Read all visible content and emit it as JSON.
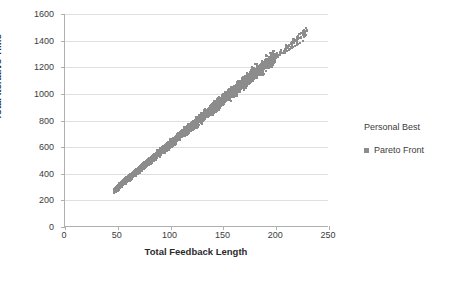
{
  "chart_data": {
    "type": "scatter",
    "title": "",
    "xlabel": "Total Feedback Length",
    "ylabel": "Total Iterative Time",
    "xlim": [
      0,
      250
    ],
    "ylim": [
      0,
      1600
    ],
    "xticks": [
      0,
      50,
      100,
      150,
      200,
      250
    ],
    "yticks": [
      0,
      200,
      400,
      600,
      800,
      1000,
      1200,
      1400,
      1600
    ],
    "grid": "horizontal",
    "legend_position": "right",
    "legend_title": "Personal Best",
    "series": [
      {
        "name": "Pareto Front",
        "color": "#8c8c8c",
        "marker": "square",
        "points": [
          [
            46,
            270
          ],
          [
            47,
            275
          ],
          [
            47,
            285
          ],
          [
            48,
            290
          ],
          [
            48,
            300
          ],
          [
            49,
            295
          ],
          [
            49,
            305
          ],
          [
            50,
            310
          ],
          [
            50,
            318
          ],
          [
            51,
            322
          ],
          [
            52,
            330
          ],
          [
            53,
            338
          ],
          [
            54,
            345
          ],
          [
            55,
            352
          ],
          [
            56,
            358
          ],
          [
            57,
            365
          ],
          [
            58,
            372
          ],
          [
            59,
            378
          ],
          [
            60,
            385
          ],
          [
            61,
            392
          ],
          [
            62,
            398
          ],
          [
            63,
            405
          ],
          [
            64,
            412
          ],
          [
            65,
            418
          ],
          [
            66,
            425
          ],
          [
            67,
            432
          ],
          [
            68,
            438
          ],
          [
            69,
            445
          ],
          [
            70,
            452
          ],
          [
            71,
            458
          ],
          [
            72,
            465
          ],
          [
            73,
            472
          ],
          [
            74,
            478
          ],
          [
            75,
            485
          ],
          [
            76,
            492
          ],
          [
            77,
            498
          ],
          [
            78,
            505
          ],
          [
            79,
            512
          ],
          [
            80,
            518
          ],
          [
            81,
            525
          ],
          [
            82,
            532
          ],
          [
            83,
            538
          ],
          [
            84,
            545
          ],
          [
            85,
            552
          ],
          [
            86,
            558
          ],
          [
            87,
            565
          ],
          [
            88,
            572
          ],
          [
            89,
            578
          ],
          [
            90,
            585
          ],
          [
            91,
            592
          ],
          [
            92,
            598
          ],
          [
            93,
            605
          ],
          [
            94,
            612
          ],
          [
            95,
            618
          ],
          [
            96,
            625
          ],
          [
            97,
            632
          ],
          [
            98,
            638
          ],
          [
            99,
            645
          ],
          [
            100,
            652
          ],
          [
            101,
            658
          ],
          [
            102,
            665
          ],
          [
            103,
            672
          ],
          [
            104,
            678
          ],
          [
            105,
            685
          ],
          [
            106,
            692
          ],
          [
            107,
            698
          ],
          [
            108,
            705
          ],
          [
            109,
            712
          ],
          [
            110,
            718
          ],
          [
            111,
            725
          ],
          [
            112,
            732
          ],
          [
            113,
            738
          ],
          [
            114,
            745
          ],
          [
            115,
            752
          ],
          [
            116,
            758
          ],
          [
            117,
            765
          ],
          [
            118,
            772
          ],
          [
            119,
            778
          ],
          [
            120,
            785
          ],
          [
            121,
            792
          ],
          [
            122,
            798
          ],
          [
            123,
            805
          ],
          [
            124,
            812
          ],
          [
            125,
            818
          ],
          [
            126,
            825
          ],
          [
            127,
            832
          ],
          [
            128,
            838
          ],
          [
            129,
            845
          ],
          [
            130,
            852
          ],
          [
            131,
            858
          ],
          [
            132,
            865
          ],
          [
            133,
            872
          ],
          [
            134,
            878
          ],
          [
            135,
            885
          ],
          [
            136,
            892
          ],
          [
            137,
            898
          ],
          [
            138,
            905
          ],
          [
            139,
            912
          ],
          [
            140,
            918
          ],
          [
            141,
            925
          ],
          [
            142,
            932
          ],
          [
            143,
            938
          ],
          [
            144,
            945
          ],
          [
            145,
            952
          ],
          [
            146,
            958
          ],
          [
            147,
            965
          ],
          [
            148,
            972
          ],
          [
            149,
            978
          ],
          [
            150,
            985
          ],
          [
            151,
            992
          ],
          [
            152,
            998
          ],
          [
            153,
            1005
          ],
          [
            154,
            1012
          ],
          [
            155,
            1018
          ],
          [
            156,
            1025
          ],
          [
            157,
            1032
          ],
          [
            158,
            1038
          ],
          [
            159,
            1045
          ],
          [
            160,
            1052
          ],
          [
            161,
            1058
          ],
          [
            162,
            1065
          ],
          [
            163,
            1072
          ],
          [
            164,
            1078
          ],
          [
            165,
            1085
          ],
          [
            166,
            1092
          ],
          [
            167,
            1098
          ],
          [
            168,
            1105
          ],
          [
            169,
            1112
          ],
          [
            170,
            1118
          ],
          [
            171,
            1125
          ],
          [
            172,
            1132
          ],
          [
            173,
            1138
          ],
          [
            174,
            1145
          ],
          [
            175,
            1152
          ],
          [
            176,
            1158
          ],
          [
            177,
            1165
          ],
          [
            178,
            1172
          ],
          [
            179,
            1178
          ],
          [
            180,
            1180
          ],
          [
            181,
            1185
          ],
          [
            182,
            1190
          ],
          [
            183,
            1198
          ],
          [
            184,
            1205
          ],
          [
            185,
            1210
          ],
          [
            186,
            1215
          ],
          [
            187,
            1222
          ],
          [
            188,
            1228
          ],
          [
            189,
            1230
          ],
          [
            190,
            1238
          ],
          [
            191,
            1245
          ],
          [
            193,
            1255
          ],
          [
            195,
            1265
          ],
          [
            197,
            1272
          ],
          [
            199,
            1280
          ],
          [
            201,
            1288
          ],
          [
            203,
            1295
          ],
          [
            205,
            1305
          ],
          [
            208,
            1318
          ],
          [
            210,
            1325
          ],
          [
            212,
            1332
          ],
          [
            215,
            1345
          ],
          [
            218,
            1360
          ],
          [
            220,
            1368
          ],
          [
            223,
            1385
          ],
          [
            225,
            1400
          ],
          [
            228,
            1440
          ],
          [
            226,
            1425
          ],
          [
            221,
            1372
          ],
          [
            216,
            1350
          ],
          [
            213,
            1338
          ],
          [
            209,
            1320
          ],
          [
            206,
            1308
          ],
          [
            204,
            1298
          ],
          [
            202,
            1292
          ],
          [
            200,
            1284
          ],
          [
            198,
            1276
          ],
          [
            196,
            1268
          ],
          [
            194,
            1260
          ],
          [
            192,
            1250
          ],
          [
            191,
            1242
          ]
        ],
        "cloud_note": "Dense elongated cluster from about (46,270) to (228,1440) with vertical spread of roughly +/- 40 units around the trend line y = 6.6x - 35"
      }
    ]
  }
}
